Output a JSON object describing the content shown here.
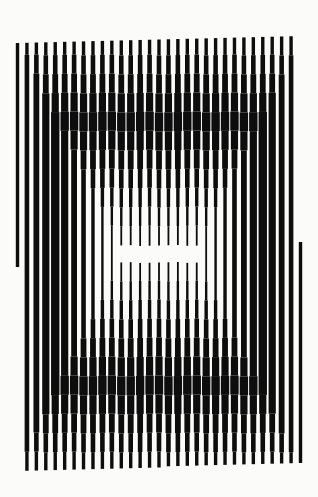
{
  "artwork": {
    "title": "Concentric rectangles formed by vertical lines of varying thickness",
    "background": "#fbfbf9",
    "ink": "#0d0d0d",
    "canvas": {
      "width": 318,
      "height": 497
    },
    "columns": {
      "count": 31,
      "x_first": 17.5,
      "x_last": 300.5,
      "top_left_y": 43,
      "top_right_y": 36,
      "bottom_left_y": 471,
      "bottom_right_y": 462
    },
    "rings": {
      "center_x": 161,
      "center_y": 253,
      "step_x": 9.2,
      "step_y": 19,
      "levels_widths": [
        1.6,
        2.4,
        3.4,
        4.6,
        5.8,
        7.2,
        8.4,
        7.2,
        5.8,
        4.6,
        3.4,
        2.4,
        1.8
      ],
      "level_offset": 0
    },
    "center_gap": {
      "x": 120,
      "y": 245,
      "width": 85,
      "height": 17
    },
    "edge_cuts": [
      {
        "column": 0,
        "y_start": 43,
        "y_end": 266
      },
      {
        "column": 30,
        "y_start": 242,
        "y_end": 462
      }
    ]
  }
}
